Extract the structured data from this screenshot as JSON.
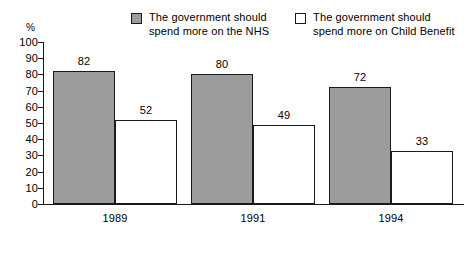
{
  "chart_data": {
    "type": "bar",
    "title": "",
    "subtitle": "",
    "xlabel": "",
    "ylabel": "%",
    "ylim": [
      0,
      100
    ],
    "ytick_step": 10,
    "yticks": [
      "100",
      "90",
      "80",
      "70",
      "60",
      "50",
      "40",
      "30",
      "20",
      "10",
      "0"
    ],
    "grid": false,
    "legend_position": "top-center",
    "categories": [
      "1989",
      "1991",
      "1994"
    ],
    "series": [
      {
        "name": "The government should\nspend more on the NHS",
        "swatch": "filled",
        "color": "#9c9c9c",
        "values": [
          82,
          80,
          72
        ],
        "value_labels": [
          "82",
          "80",
          "72"
        ]
      },
      {
        "name": "The government should\nspend more on Child Benefit",
        "swatch": "hollow",
        "color": "#ffffff",
        "values": [
          52,
          49,
          33
        ],
        "value_labels": [
          "52",
          "49",
          "33"
        ]
      }
    ]
  },
  "colors": {
    "bar_fill_nhs": "#9c9c9c",
    "bar_fill_child": "#ffffff",
    "outline": "#1a1a1a",
    "background": "#ffffff"
  },
  "axis": {
    "percent_symbol": "%"
  }
}
